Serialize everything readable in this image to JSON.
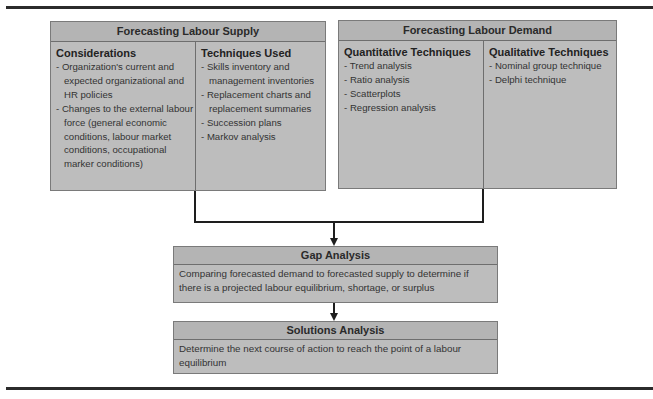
{
  "supply": {
    "title": "Forecasting Labour Supply",
    "considerations": {
      "title": "Considerations",
      "items": [
        "Organization's current and expected organizational and HR policies",
        "Changes to the external labour force (general economic conditions, labour market conditions, occupational marker conditions)"
      ]
    },
    "techniques": {
      "title": "Techniques Used",
      "items": [
        "Skills inventory and management inventories",
        "Replacement charts and replacement summaries",
        "Succession plans",
        "Markov analysis"
      ]
    }
  },
  "demand": {
    "title": "Forecasting Labour Demand",
    "quantitative": {
      "title": "Quantitative Techniques",
      "items": [
        "Trend analysis",
        "Ratio analysis",
        "Scatterplots",
        "Regression analysis"
      ]
    },
    "qualitative": {
      "title": "Qualitative Techniques",
      "items": [
        "Nominal group technique",
        "Delphi technique"
      ]
    }
  },
  "gap": {
    "title": "Gap Analysis",
    "text": "Comparing forecasted demand to forecasted supply to determine if there is a projected labour equilibrium, shortage, or surplus"
  },
  "solutions": {
    "title": "Solutions Analysis",
    "text": "Determine the next course of action to reach the point of a labour equilibrium"
  },
  "colors": {
    "box_fill": "#bdbdbd",
    "header_fill": "#b4b4b4",
    "rule": "#2b2b2b",
    "connector": "#1e1e1e"
  }
}
